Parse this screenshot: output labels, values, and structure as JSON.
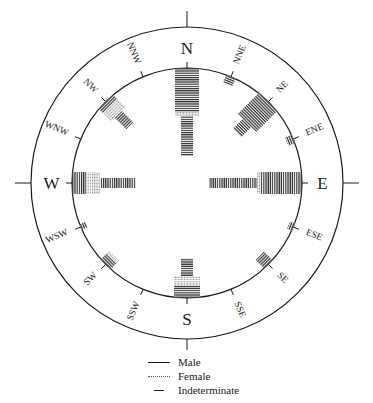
{
  "figure": {
    "type": "orientation rose diagram (burial orientations)",
    "top_caption_cut": "",
    "center": [
      187,
      183
    ],
    "outer_radius": 156,
    "inner_radius": 115,
    "cardinal_labels": [
      {
        "label": "N",
        "angle": 0
      },
      {
        "label": "E",
        "angle": 90
      },
      {
        "label": "S",
        "angle": 180
      },
      {
        "label": "W",
        "angle": 270
      }
    ],
    "intercardinal_labels": [
      {
        "label": "NNE",
        "angle": 22.5
      },
      {
        "label": "NE",
        "angle": 45
      },
      {
        "label": "ENE",
        "angle": 67.5
      },
      {
        "label": "ESE",
        "angle": 112.5
      },
      {
        "label": "SE",
        "angle": 135
      },
      {
        "label": "SSE",
        "angle": 157.5
      },
      {
        "label": "SSW",
        "angle": 202.5
      },
      {
        "label": "SW",
        "angle": 225
      },
      {
        "label": "WSW",
        "angle": 247.5
      },
      {
        "label": "WNW",
        "angle": 292.5
      },
      {
        "label": "NW",
        "angle": 315
      },
      {
        "label": "NNW",
        "angle": 337.5
      }
    ]
  },
  "legend": {
    "male": "Male",
    "female": "Female",
    "indeterminate": "Indeterminate"
  },
  "chart_data": {
    "type": "rose",
    "title": "",
    "categories": [
      "N",
      "NNE",
      "NE",
      "ENE",
      "E",
      "ESE",
      "SE",
      "SSE",
      "S",
      "SSW",
      "SW",
      "WSW",
      "W",
      "WNW",
      "NW",
      "NNW"
    ],
    "series": [
      {
        "name": "Male",
        "values": [
          22,
          3,
          15,
          0,
          18,
          2,
          3,
          0,
          4,
          0,
          4,
          0,
          4,
          0,
          8,
          0
        ]
      },
      {
        "name": "Female",
        "values": [
          2,
          0,
          0,
          0,
          1,
          0,
          0,
          0,
          5,
          0,
          1,
          0,
          6,
          0,
          3,
          0
        ]
      },
      {
        "name": "Indeterminate",
        "values": [
          10,
          0,
          6,
          3,
          25,
          1,
          2,
          0,
          4,
          0,
          0,
          2,
          18,
          0,
          2,
          0
        ]
      }
    ],
    "bars_px": [
      {
        "dir": "N",
        "segments": [
          {
            "kind": "male",
            "len": 44,
            "width": 24
          },
          {
            "kind": "female",
            "len": 4,
            "width": 24
          },
          {
            "kind": "indet",
            "len": 40,
            "width": 12
          }
        ]
      },
      {
        "dir": "NNE",
        "segments": [
          {
            "kind": "male",
            "len": 8,
            "width": 10
          }
        ]
      },
      {
        "dir": "NE",
        "segments": [
          {
            "kind": "male",
            "len": 30,
            "width": 26
          },
          {
            "kind": "indet",
            "len": 14,
            "width": 12
          }
        ]
      },
      {
        "dir": "ENE",
        "segments": [
          {
            "kind": "male",
            "len": 7,
            "width": 9
          }
        ]
      },
      {
        "dir": "E",
        "segments": [
          {
            "kind": "male",
            "len": 42,
            "width": 22
          },
          {
            "kind": "female",
            "len": 3,
            "width": 22
          },
          {
            "kind": "indet",
            "len": 48,
            "width": 10
          }
        ]
      },
      {
        "dir": "ESE",
        "segments": [
          {
            "kind": "male",
            "len": 5,
            "width": 8
          }
        ]
      },
      {
        "dir": "SE",
        "segments": [
          {
            "kind": "male",
            "len": 12,
            "width": 12
          }
        ]
      },
      {
        "dir": "S",
        "segments": [
          {
            "kind": "male",
            "len": 12,
            "width": 26
          },
          {
            "kind": "female",
            "len": 10,
            "width": 26
          },
          {
            "kind": "indet",
            "len": 18,
            "width": 12
          }
        ]
      },
      {
        "dir": "SW",
        "segments": [
          {
            "kind": "male",
            "len": 8,
            "width": 14
          },
          {
            "kind": "female",
            "len": 4,
            "width": 14
          }
        ]
      },
      {
        "dir": "WSW",
        "segments": [
          {
            "kind": "male",
            "len": 6,
            "width": 6
          }
        ]
      },
      {
        "dir": "W",
        "segments": [
          {
            "kind": "male",
            "len": 14,
            "width": 22
          },
          {
            "kind": "female",
            "len": 14,
            "width": 22
          },
          {
            "kind": "indet",
            "len": 36,
            "width": 10
          }
        ]
      },
      {
        "dir": "NW",
        "segments": [
          {
            "kind": "male",
            "len": 6,
            "width": 20
          },
          {
            "kind": "female",
            "len": 12,
            "width": 20
          },
          {
            "kind": "indet",
            "len": 16,
            "width": 10
          }
        ]
      }
    ],
    "legend_position": "bottom-center"
  }
}
